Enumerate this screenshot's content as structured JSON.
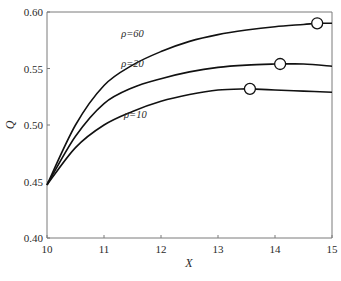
{
  "chart_data": {
    "type": "line",
    "title": "",
    "xlabel": "X",
    "ylabel": "Q",
    "xlim": [
      10,
      15
    ],
    "ylim": [
      0.4,
      0.6
    ],
    "xticks": [
      10,
      11,
      12,
      13,
      14,
      15
    ],
    "xtick_labels": [
      "10",
      "11",
      "12",
      "13",
      "14",
      "15"
    ],
    "yticks": [
      0.4,
      0.45,
      0.5,
      0.55,
      0.6
    ],
    "ytick_labels": [
      "0.40",
      "0.45",
      "0.50",
      "0.55",
      "0.60"
    ],
    "grid": false,
    "legend": "inline labels on curves",
    "series": [
      {
        "name": "ρ=60",
        "label": "ρ=60",
        "x": [
          10,
          10.5,
          11,
          11.5,
          12,
          12.5,
          13,
          13.5,
          14,
          14.5,
          14.74,
          15
        ],
        "y": [
          0.447,
          0.5,
          0.535,
          0.553,
          0.565,
          0.574,
          0.58,
          0.584,
          0.587,
          0.589,
          0.59,
          0.59
        ],
        "marker": {
          "x": 14.74,
          "y": 0.59
        },
        "label_pos": {
          "x": 11.5,
          "y": 0.578
        }
      },
      {
        "name": "ρ=20",
        "label": "ρ=20",
        "x": [
          10,
          10.5,
          11,
          11.5,
          12,
          12.5,
          13,
          13.5,
          14,
          14.09,
          14.5,
          15
        ],
        "y": [
          0.447,
          0.49,
          0.519,
          0.533,
          0.541,
          0.547,
          0.551,
          0.553,
          0.554,
          0.554,
          0.554,
          0.552
        ],
        "marker": {
          "x": 14.09,
          "y": 0.554
        },
        "label_pos": {
          "x": 11.5,
          "y": 0.551
        }
      },
      {
        "name": "ρ=10",
        "label": "ρ=10",
        "x": [
          10,
          10.5,
          11,
          11.5,
          12,
          12.5,
          13,
          13.5,
          13.56,
          14,
          14.5,
          15
        ],
        "y": [
          0.447,
          0.48,
          0.5,
          0.512,
          0.521,
          0.527,
          0.531,
          0.532,
          0.532,
          0.531,
          0.53,
          0.529
        ],
        "marker": {
          "x": 13.56,
          "y": 0.532
        },
        "label_pos": {
          "x": 11.55,
          "y": 0.506
        }
      }
    ]
  },
  "style": {
    "curve_color": "#111111",
    "axis_color": "#7a7a7a",
    "text_color": "#2a2a2a",
    "background": "#ffffff"
  }
}
